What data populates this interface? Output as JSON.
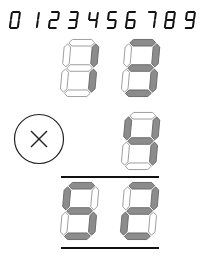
{
  "colors": {
    "background": "#ffffff",
    "segment_on_fill": "#8c8c8c",
    "segment_on_stroke": "#6a6a6a",
    "segment_off_fill": "#ffffff",
    "segment_off_stroke": "#9a9a9a",
    "ink": "#111111"
  },
  "reference_digits": {
    "label": "Digit reference",
    "values": [
      "0",
      "1",
      "2",
      "3",
      "4",
      "5",
      "6",
      "7",
      "8",
      "9"
    ]
  },
  "multiplicand": {
    "digits": [
      {
        "value": "1",
        "segments": [
          "b",
          "c"
        ]
      },
      {
        "value": "3",
        "segments": [
          "a",
          "b",
          "c",
          "d",
          "g"
        ]
      }
    ]
  },
  "operator": {
    "symbol": "×",
    "name": "multiply"
  },
  "multiplier": {
    "digits": [
      {
        "value": "4",
        "segments": [
          "b",
          "c",
          "f",
          "g"
        ]
      }
    ]
  },
  "product": {
    "digits": [
      {
        "value": "5",
        "segments": [
          "a",
          "c",
          "d",
          "f",
          "g"
        ]
      },
      {
        "value": "2",
        "segments": [
          "a",
          "b",
          "d",
          "e",
          "g"
        ]
      }
    ]
  },
  "equation_text": "13 × 4 = 52"
}
